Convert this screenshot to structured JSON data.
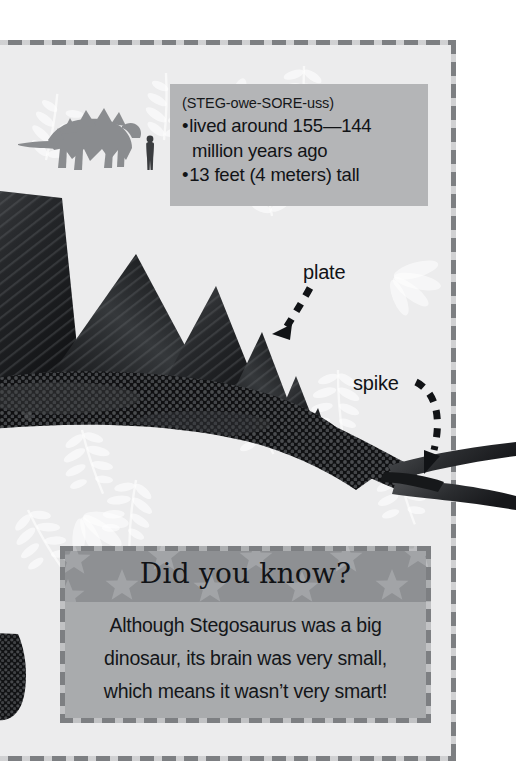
{
  "page": {
    "title": "Stegosaurus",
    "background_color": "#ececed",
    "border_color": "#7d7f82",
    "border_style": "dashed"
  },
  "scale_diagram": {
    "name": "stegosaurus-scale-silhouette",
    "dinosaur_silhouette_color": "#8a8c8f",
    "human_silhouette_color": "#3a3c3f",
    "description": "Stegosaurus silhouette next to human figure for size comparison"
  },
  "fact_box": {
    "background_color": "#b4b5b7",
    "pronunciation": "(STEG-owe-SORE-uss)",
    "facts": [
      "lived around 155—144",
      "million years ago",
      "13 feet (4 meters) tall"
    ],
    "bullet_lines": [
      {
        "bullet": true,
        "text": "lived around 155—144"
      },
      {
        "bullet": false,
        "text": "million years ago"
      },
      {
        "bullet": true,
        "text": "13 feet (4 meters) tall"
      }
    ]
  },
  "callouts": [
    {
      "label": "plate",
      "arrow": "curved-dashed-arrow-left"
    },
    {
      "label": "spike",
      "arrow": "curved-dashed-arrow-down-right"
    }
  ],
  "did_you_know": {
    "header": "Did you know?",
    "header_background_color": "#8e9093",
    "body_background_color": "#a9abad",
    "star_pattern_color": "#a0a2a5",
    "body_lines": [
      "Although Stegosaurus was a big",
      "dinosaur, its brain was very small,",
      "which means it wasn’t very smart!"
    ]
  },
  "artwork": {
    "name": "stegosaurus-illustration",
    "description": "Dark textured Stegosaurus with row of triangular back plates and tail spikes",
    "body_color": "#1c1d1f",
    "plate_color": "#2b2c2e"
  }
}
